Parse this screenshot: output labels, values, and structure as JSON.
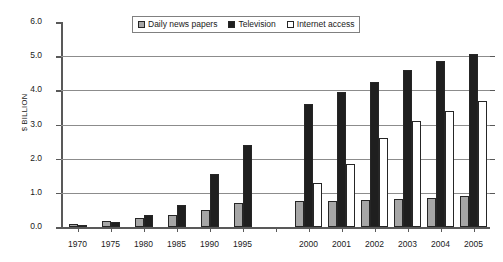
{
  "chart_data": {
    "type": "bar",
    "title": "",
    "xlabel": "",
    "ylabel": "$ BILLION",
    "ylim": [
      0,
      6
    ],
    "ytick_labels": [
      "0.0",
      "1.0",
      "2.0",
      "3.0",
      "4.0",
      "5.0",
      "6.0"
    ],
    "ytick_values": [
      0,
      1,
      2,
      3,
      4,
      5,
      6
    ],
    "grid": "horizontal gridlines at 1.0 through 5.0",
    "legend_position": "top-center",
    "categories": [
      "1970",
      "1975",
      "1980",
      "1985",
      "1990",
      "1995",
      "",
      "2000",
      "2001",
      "2002",
      "2003",
      "2004",
      "2005"
    ],
    "series": [
      {
        "name": "Daily news papers",
        "color": "#a6a6a6",
        "values": [
          0.1,
          0.17,
          0.25,
          0.35,
          0.5,
          0.7,
          null,
          0.75,
          0.75,
          0.78,
          0.82,
          0.85,
          0.9
        ]
      },
      {
        "name": "Television",
        "color": "#1f1f1f",
        "values": [
          0.06,
          0.16,
          0.35,
          0.65,
          1.55,
          2.4,
          null,
          3.6,
          3.95,
          4.25,
          4.6,
          4.85,
          5.05
        ]
      },
      {
        "name": "Internet access",
        "color": "#ffffff",
        "values": [
          null,
          null,
          null,
          null,
          null,
          null,
          null,
          1.3,
          1.85,
          2.6,
          3.1,
          3.4,
          3.7
        ]
      }
    ]
  },
  "legend": {
    "items": [
      {
        "label": "Daily news papers",
        "swatch": "gray-square-icon"
      },
      {
        "label": "Television",
        "swatch": "black-square-icon"
      },
      {
        "label": "Internet access",
        "swatch": "white-square-icon"
      }
    ]
  }
}
